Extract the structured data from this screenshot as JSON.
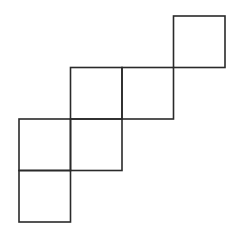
{
  "diagram": {
    "type": "square-net",
    "stroke_color": "#2a2a2a",
    "background": "#ffffff",
    "cell_size": 51.5,
    "origin": [
      19,
      16
    ],
    "cells": [
      {
        "col": 3,
        "row": 0
      },
      {
        "col": 1,
        "row": 1
      },
      {
        "col": 2,
        "row": 1
      },
      {
        "col": 0,
        "row": 2
      },
      {
        "col": 1,
        "row": 2
      },
      {
        "col": 0,
        "row": 3
      }
    ]
  }
}
